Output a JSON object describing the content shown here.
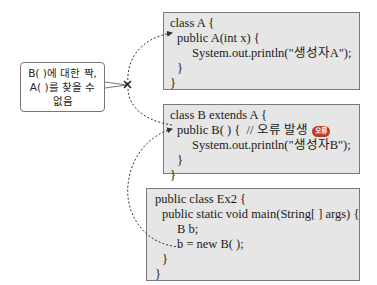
{
  "diagram": {
    "class_a": {
      "lines": [
        "class A {",
        "public A(int x) {",
        "System.out.println(\"생성자A\");",
        "}",
        "}"
      ]
    },
    "class_b": {
      "lines": [
        "class B extends A {",
        "public B( ) {  // 오류 발생",
        "System.out.println(\"생성자B\");",
        "}",
        "}"
      ],
      "badge": "오류"
    },
    "class_ex2": {
      "lines": [
        "public class Ex2 {",
        "public static void main(String[ ] args) {",
        "B b;",
        "b = new B( );",
        "}",
        "}"
      ]
    },
    "callout": {
      "lines": [
        "B( )에 대한 짝,",
        "A( )를 찾을 수",
        "없음"
      ]
    },
    "colors": {
      "box_bg": "#e6e6e6",
      "box_border": "#7a7a7a",
      "badge": "#c0392b",
      "arrow": "#333333"
    }
  }
}
